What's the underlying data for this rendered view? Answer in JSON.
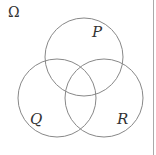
{
  "diagram": {
    "type": "venn",
    "universe_label": "Ω",
    "sets": [
      {
        "label": "P",
        "cx": 84,
        "cy": 57,
        "r": 39,
        "label_x": 92,
        "label_y": 37
      },
      {
        "label": "Q",
        "cx": 57,
        "cy": 98,
        "r": 39,
        "label_x": 30,
        "label_y": 124
      },
      {
        "label": "R",
        "cx": 104,
        "cy": 98,
        "r": 39,
        "label_x": 117,
        "label_y": 124
      }
    ],
    "stroke_color": "#888888",
    "border_color": "#aaaaaa"
  }
}
